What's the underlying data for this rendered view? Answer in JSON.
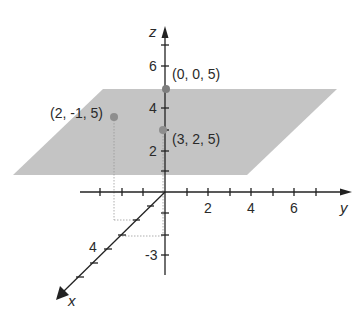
{
  "diagram": {
    "colors": {
      "plane": "#c4c4c4",
      "axis": "#222222",
      "point": "#8a8a8a",
      "guide": "#9a9a9a"
    },
    "axes": {
      "x": {
        "label": "x",
        "tick_labels": [
          {
            "value": "4"
          }
        ]
      },
      "y": {
        "label": "y",
        "tick_labels": [
          {
            "value": "2"
          },
          {
            "value": "4"
          },
          {
            "value": "6"
          }
        ]
      },
      "z": {
        "label": "z",
        "tick_labels": [
          {
            "value": "6"
          },
          {
            "value": "4"
          },
          {
            "value": "2"
          },
          {
            "value": "-3"
          }
        ]
      }
    },
    "points": [
      {
        "label": "(0, 0, 5)",
        "x": 0,
        "y": 0,
        "z": 5
      },
      {
        "label": "(2, -1, 5)",
        "x": 2,
        "y": -1,
        "z": 5
      },
      {
        "label": "(3, 2, 5)",
        "x": 3,
        "y": 2,
        "z": 5
      }
    ]
  }
}
